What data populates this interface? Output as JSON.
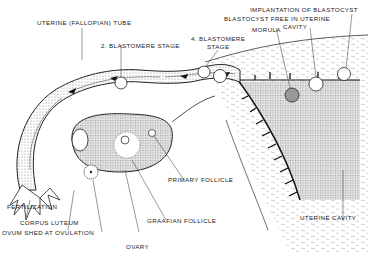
{
  "diagram": {
    "labels": {
      "uterine_tube": "UTERINE (FALLOPIAN) TUBE",
      "two_blastomere": "2. BLASTOMERE STAGE",
      "four_blastomere_line1": "4. BLASTOMERE",
      "four_blastomere_line2": "STAGE",
      "implantation": "IMPLANTATION OF BLASTOCYST",
      "blastocyst_free_line1": "BLASTOCYST FREE IN UTERINE",
      "blastocyst_free_line2": "CAVITY",
      "morula": "MORULA",
      "fertilization": "FERTILIZATION",
      "corpus_luteum": "CORPUS LUTEUM",
      "ovum_shed": "OVUM SHED AT OVULATION",
      "ovary": "OVARY",
      "primary_follicle": "PRIMARY FOLLICLE",
      "graafian_follicle": "GRAAFIAN FOLLICLE",
      "uterine_cavity": "UTERINE CAVITY"
    },
    "colors": {
      "ink": "#222222",
      "stipple": "#9a9a9a",
      "cavity_fill": "#d8d8d8",
      "ovary_fill": "#cfcfcf"
    }
  }
}
